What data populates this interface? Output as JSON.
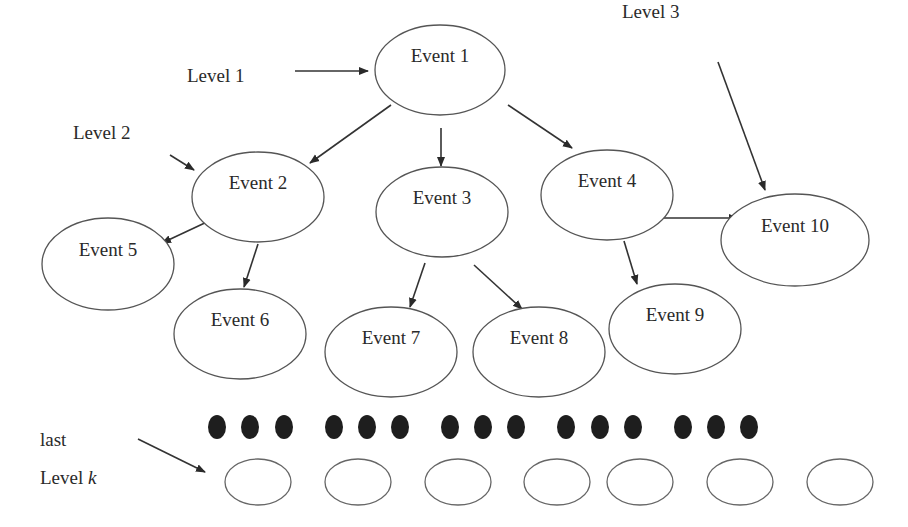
{
  "diagram": {
    "type": "hierarchical-event-tree",
    "nodes": [
      {
        "id": "e1",
        "label": "Event 1",
        "level": 1,
        "cx": 440,
        "cy": 70,
        "rx": 65,
        "ry": 45
      },
      {
        "id": "e2",
        "label": "Event 2",
        "level": 2,
        "cx": 258,
        "cy": 197,
        "rx": 66,
        "ry": 45
      },
      {
        "id": "e3",
        "label": "Event 3",
        "level": 2,
        "cx": 442,
        "cy": 212,
        "rx": 66,
        "ry": 45
      },
      {
        "id": "e4",
        "label": "Event 4",
        "level": 2,
        "cx": 607,
        "cy": 195,
        "rx": 66,
        "ry": 45
      },
      {
        "id": "e5",
        "label": "Event 5",
        "level": 3,
        "cx": 108,
        "cy": 264,
        "rx": 66,
        "ry": 46
      },
      {
        "id": "e6",
        "label": "Event 6",
        "level": 3,
        "cx": 240,
        "cy": 334,
        "rx": 66,
        "ry": 45
      },
      {
        "id": "e7",
        "label": "Event 7",
        "level": 3,
        "cx": 391,
        "cy": 352,
        "rx": 66,
        "ry": 45
      },
      {
        "id": "e8",
        "label": "Event 8",
        "level": 3,
        "cx": 539,
        "cy": 352,
        "rx": 66,
        "ry": 45
      },
      {
        "id": "e9",
        "label": "Event 9",
        "level": 3,
        "cx": 675,
        "cy": 329,
        "rx": 66,
        "ry": 45
      },
      {
        "id": "e10",
        "label": "Event 10",
        "level": 3,
        "cx": 795,
        "cy": 240,
        "rx": 74,
        "ry": 46
      }
    ],
    "edges": [
      {
        "from": "e1",
        "to": "e2",
        "x1": 391,
        "y1": 105,
        "x2": 310,
        "y2": 163
      },
      {
        "from": "e1",
        "to": "e3",
        "x1": 441,
        "y1": 128,
        "x2": 441,
        "y2": 166
      },
      {
        "from": "e1",
        "to": "e4",
        "x1": 508,
        "y1": 105,
        "x2": 572,
        "y2": 148
      },
      {
        "from": "e2",
        "to": "e5",
        "x1": 209,
        "y1": 221,
        "x2": 162,
        "y2": 243
      },
      {
        "from": "e2",
        "to": "e6",
        "x1": 258,
        "y1": 244,
        "x2": 244,
        "y2": 287
      },
      {
        "from": "e3",
        "to": "e7",
        "x1": 425,
        "y1": 263,
        "x2": 410,
        "y2": 307
      },
      {
        "from": "e3",
        "to": "e8",
        "x1": 474,
        "y1": 265,
        "x2": 522,
        "y2": 309
      },
      {
        "from": "e4",
        "to": "e9",
        "x1": 624,
        "y1": 241,
        "x2": 637,
        "y2": 284
      },
      {
        "from": "e4",
        "to": "e10",
        "x1": 657,
        "y1": 218,
        "x2": 738,
        "y2": 218
      }
    ],
    "level_labels": [
      {
        "id": "level1",
        "text": "Level 1",
        "x": 187,
        "y": 110,
        "arrow": {
          "x1": 295,
          "y1": 71,
          "x2": 368,
          "y2": 71
        }
      },
      {
        "id": "level2",
        "text": "Level 2",
        "x": 73,
        "y": 167,
        "arrow": {
          "x1": 170,
          "y1": 155,
          "x2": 194,
          "y2": 170
        }
      },
      {
        "id": "level3",
        "text": "Level 3",
        "x": 622,
        "y": 46,
        "arrow": {
          "x1": 718,
          "y1": 62,
          "x2": 765,
          "y2": 190
        }
      }
    ],
    "last_level": {
      "line1": "last",
      "line2_prefix": "Level ",
      "line2_var": "k",
      "x": 40,
      "y1": 446,
      "y2": 484,
      "arrow": {
        "x1": 138,
        "y1": 439,
        "x2": 205,
        "y2": 472
      }
    },
    "ellipsis_dots": {
      "cy": 427,
      "rx": 9,
      "ry": 12,
      "xs": [
        217,
        250,
        284,
        334,
        367,
        400,
        450,
        483,
        516,
        566,
        600,
        633,
        683,
        716,
        749
      ]
    },
    "leaf_placeholders": {
      "cy": 482,
      "rx": 33,
      "ry": 23,
      "cxs": [
        258,
        358,
        458,
        557,
        640,
        740,
        840
      ]
    },
    "colors": {
      "background": "#ffffff",
      "stroke": "#555555",
      "text": "#2a2a2a",
      "dot_fill": "#1e1e1e"
    }
  }
}
